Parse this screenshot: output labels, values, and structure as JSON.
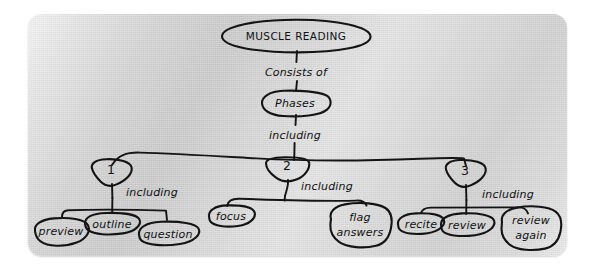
{
  "diagram": {
    "kind": "hand-drawn-concept-map",
    "title_node": {
      "label": "MUSCLE READING"
    },
    "ink_color": "#141414",
    "board_color": "#d4d4d4",
    "links": {
      "consists_of": "Consists of",
      "including_root": "including",
      "including_1": "including",
      "including_2": "including",
      "including_3": "including"
    },
    "phases_node": {
      "label": "Phases"
    },
    "phase_numbers": {
      "one": "1",
      "two": "2",
      "three": "3"
    },
    "phase1_leaves": [
      {
        "label": "preview"
      },
      {
        "label": "outline"
      },
      {
        "label": "question"
      }
    ],
    "phase2_leaves": [
      {
        "label": "focus"
      },
      {
        "label_line1": "flag",
        "label_line2": "answers"
      }
    ],
    "phase3_leaves": [
      {
        "label": "recite"
      },
      {
        "label": "review"
      },
      {
        "label_line1": "review",
        "label_line2": "again"
      }
    ]
  }
}
